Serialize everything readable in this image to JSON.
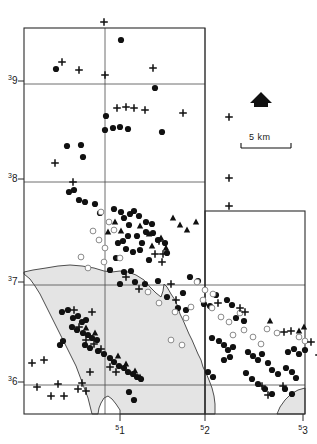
{
  "figure": {
    "type": "map"
  },
  "axes": {
    "y_labels": [
      {
        "sup": "3",
        "num": "9",
        "y": 84
      },
      {
        "sup": "3",
        "num": "8",
        "y": 182
      },
      {
        "sup": "3",
        "num": "7",
        "y": 285
      },
      {
        "sup": "3",
        "num": "6",
        "y": 385
      }
    ],
    "x_labels": [
      {
        "sup": "5",
        "num": "1",
        "x": 120
      },
      {
        "sup": "5",
        "num": "2",
        "x": 205
      },
      {
        "sup": "5",
        "num": "3",
        "x": 303
      }
    ]
  },
  "scale_bar": {
    "label": "5 km",
    "x1": 241,
    "x2": 291,
    "y": 148
  },
  "north_arrow": {
    "name": "north-arrow",
    "cx": 261,
    "cy": 101
  },
  "grid": {
    "color": "#4a4a4a",
    "vertical_x": [
      24,
      105,
      205,
      305
    ],
    "horizontal_y": [
      28,
      84,
      182,
      285,
      385,
      414
    ],
    "right_panel": {
      "x1": 205,
      "y1": 211,
      "x2": 305,
      "y2": 414
    }
  },
  "frame": {
    "main": {
      "x1": 24,
      "y1": 28,
      "x2": 205,
      "y2": 414
    },
    "extension": {
      "x1": 205,
      "y1": 211,
      "x2": 305,
      "y2": 414
    }
  },
  "sea": {
    "fill": "#e4e4e4",
    "stroke": "#3b3b3b"
  },
  "chart_data": {
    "type": "scatter",
    "title": "",
    "xlabel": "",
    "ylabel": "",
    "series": [
      {
        "name": "filled-circle",
        "marker": "filled circle",
        "points": [
          [
            121,
            40
          ],
          [
            56,
            69
          ],
          [
            155,
            88
          ],
          [
            106,
            116
          ],
          [
            105,
            130
          ],
          [
            113,
            128
          ],
          [
            120,
            127
          ],
          [
            128,
            129
          ],
          [
            162,
            132
          ],
          [
            67,
            146
          ],
          [
            81,
            145
          ],
          [
            83,
            157
          ],
          [
            69,
            192
          ],
          [
            74,
            190
          ],
          [
            79,
            200
          ],
          [
            85,
            202
          ],
          [
            95,
            204
          ],
          [
            100,
            213
          ],
          [
            114,
            209
          ],
          [
            121,
            212
          ],
          [
            124,
            218
          ],
          [
            130,
            214
          ],
          [
            134,
            211
          ],
          [
            139,
            216
          ],
          [
            129,
            225
          ],
          [
            146,
            222
          ],
          [
            152,
            224
          ],
          [
            128,
            236
          ],
          [
            137,
            236
          ],
          [
            142,
            243
          ],
          [
            146,
            232
          ],
          [
            153,
            233
          ],
          [
            158,
            240
          ],
          [
            118,
            243
          ],
          [
            123,
            241
          ],
          [
            126,
            249
          ],
          [
            133,
            252
          ],
          [
            140,
            250
          ],
          [
            116,
            258
          ],
          [
            149,
            260
          ],
          [
            165,
            243
          ],
          [
            167,
            253
          ],
          [
            110,
            270
          ],
          [
            124,
            272
          ],
          [
            131,
            271
          ],
          [
            120,
            284
          ],
          [
            135,
            282
          ],
          [
            145,
            284
          ],
          [
            158,
            281
          ],
          [
            190,
            277
          ],
          [
            198,
            281
          ],
          [
            183,
            293
          ],
          [
            167,
            297
          ],
          [
            178,
            308
          ],
          [
            186,
            310
          ],
          [
            204,
            304
          ],
          [
            210,
            306
          ],
          [
            216,
            295
          ],
          [
            227,
            300
          ],
          [
            232,
            305
          ],
          [
            236,
            318
          ],
          [
            244,
            321
          ],
          [
            62,
            312
          ],
          [
            68,
            310
          ],
          [
            73,
            318
          ],
          [
            78,
            316
          ],
          [
            82,
            322
          ],
          [
            86,
            320
          ],
          [
            72,
            327
          ],
          [
            77,
            330
          ],
          [
            83,
            333
          ],
          [
            88,
            335
          ],
          [
            92,
            338
          ],
          [
            97,
            340
          ],
          [
            85,
            345
          ],
          [
            90,
            348
          ],
          [
            98,
            351
          ],
          [
            104,
            354
          ],
          [
            110,
            358
          ],
          [
            114,
            362
          ],
          [
            119,
            366
          ],
          [
            124,
            368
          ],
          [
            128,
            372
          ],
          [
            133,
            374
          ],
          [
            137,
            377
          ],
          [
            141,
            379
          ],
          [
            129,
            392
          ],
          [
            134,
            400
          ],
          [
            60,
            345
          ],
          [
            63,
            341
          ],
          [
            212,
            338
          ],
          [
            219,
            341
          ],
          [
            224,
            345
          ],
          [
            228,
            350
          ],
          [
            233,
            347
          ],
          [
            248,
            352
          ],
          [
            253,
            356
          ],
          [
            258,
            360
          ],
          [
            262,
            354
          ],
          [
            268,
            363
          ],
          [
            272,
            370
          ],
          [
            278,
            374
          ],
          [
            286,
            368
          ],
          [
            292,
            372
          ],
          [
            296,
            378
          ],
          [
            285,
            389
          ],
          [
            292,
            394
          ],
          [
            246,
            373
          ],
          [
            252,
            379
          ],
          [
            258,
            384
          ],
          [
            265,
            389
          ],
          [
            272,
            394
          ],
          [
            208,
            372
          ],
          [
            213,
            377
          ],
          [
            288,
            352
          ],
          [
            294,
            349
          ],
          [
            299,
            354
          ],
          [
            305,
            350
          ],
          [
            224,
            360
          ],
          [
            230,
            357
          ]
        ]
      },
      {
        "name": "open-circle",
        "marker": "open circle",
        "points": [
          [
            101,
            212
          ],
          [
            109,
            222
          ],
          [
            114,
            230
          ],
          [
            93,
            231
          ],
          [
            99,
            240
          ],
          [
            81,
            257
          ],
          [
            105,
            248
          ],
          [
            88,
            268
          ],
          [
            104,
            262
          ],
          [
            120,
            258
          ],
          [
            197,
            282
          ],
          [
            205,
            290
          ],
          [
            213,
            294
          ],
          [
            203,
            300
          ],
          [
            191,
            307
          ],
          [
            212,
            308
          ],
          [
            175,
            312
          ],
          [
            186,
            318
          ],
          [
            221,
            317
          ],
          [
            229,
            322
          ],
          [
            240,
            313
          ],
          [
            233,
            335
          ],
          [
            244,
            330
          ],
          [
            253,
            337
          ],
          [
            267,
            329
          ],
          [
            277,
            333
          ],
          [
            261,
            344
          ],
          [
            299,
            337
          ],
          [
            305,
            341
          ],
          [
            171,
            340
          ],
          [
            182,
            345
          ],
          [
            148,
            292
          ],
          [
            159,
            303
          ]
        ]
      },
      {
        "name": "filled-triangle",
        "marker": "filled triangle",
        "points": [
          [
            115,
            222
          ],
          [
            108,
            232
          ],
          [
            121,
            231
          ],
          [
            140,
            226
          ],
          [
            149,
            234
          ],
          [
            152,
            246
          ],
          [
            161,
            238
          ],
          [
            166,
            248
          ],
          [
            173,
            218
          ],
          [
            180,
            225
          ],
          [
            187,
            230
          ],
          [
            196,
            222
          ],
          [
            86,
            328
          ],
          [
            95,
            333
          ],
          [
            118,
            356
          ],
          [
            126,
            364
          ],
          [
            135,
            371
          ],
          [
            140,
            377
          ],
          [
            299,
            331
          ],
          [
            304,
            327
          ],
          [
            270,
            321
          ]
        ]
      },
      {
        "name": "plus",
        "marker": "plus sign",
        "points": [
          [
            104,
            22
          ],
          [
            62,
            62
          ],
          [
            79,
            70
          ],
          [
            105,
            75
          ],
          [
            153,
            68
          ],
          [
            117,
            108
          ],
          [
            126,
            107
          ],
          [
            134,
            108
          ],
          [
            145,
            110
          ],
          [
            183,
            113
          ],
          [
            73,
            182
          ],
          [
            55,
            163
          ],
          [
            229,
            117
          ],
          [
            229,
            178
          ],
          [
            229,
            206
          ],
          [
            126,
            277
          ],
          [
            139,
            289
          ],
          [
            159,
            241
          ],
          [
            163,
            254
          ],
          [
            74,
            310
          ],
          [
            92,
            312
          ],
          [
            79,
            327
          ],
          [
            86,
            340
          ],
          [
            94,
            344
          ],
          [
            101,
            349
          ],
          [
            110,
            367
          ],
          [
            116,
            372
          ],
          [
            90,
            372
          ],
          [
            82,
            383
          ],
          [
            32,
            363
          ],
          [
            44,
            360
          ],
          [
            37,
            387
          ],
          [
            58,
            384
          ],
          [
            51,
            396
          ],
          [
            64,
            396
          ],
          [
            78,
            389
          ],
          [
            86,
            391
          ],
          [
            176,
            300
          ],
          [
            218,
            303
          ],
          [
            240,
            308
          ],
          [
            245,
            312
          ],
          [
            284,
            332
          ],
          [
            291,
            331
          ],
          [
            311,
            342
          ],
          [
            319,
            355
          ],
          [
            262,
            386
          ],
          [
            268,
            395
          ],
          [
            283,
            386
          ],
          [
            155,
            254
          ],
          [
            162,
            262
          ],
          [
            171,
            284
          ]
        ]
      }
    ]
  }
}
